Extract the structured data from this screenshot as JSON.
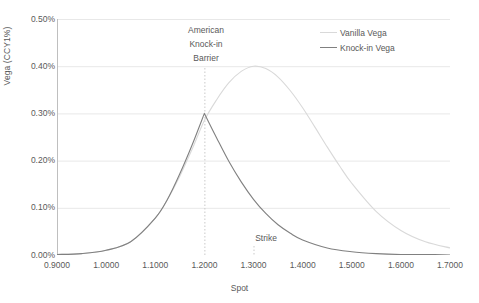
{
  "chart_data": {
    "type": "line",
    "title": "",
    "xlabel": "Spot",
    "ylabel": "Vega (CCY1%)",
    "xlim": [
      0.9,
      1.7
    ],
    "ylim": [
      0.0,
      0.005
    ],
    "grid": true,
    "grid_axis": "y",
    "legend_position": "top-right",
    "x_tick_labels": [
      "0.9000",
      "1.0000",
      "1.1000",
      "1.2000",
      "1.3000",
      "1.4000",
      "1.5000",
      "1.6000",
      "1.7000"
    ],
    "x_tick_values": [
      0.9,
      1.0,
      1.1,
      1.2,
      1.3,
      1.4,
      1.5,
      1.6,
      1.7
    ],
    "y_tick_labels": [
      "0.00%",
      "0.10%",
      "0.20%",
      "0.30%",
      "0.40%",
      "0.50%"
    ],
    "y_tick_values": [
      0.0,
      0.001,
      0.002,
      0.003,
      0.004,
      0.005
    ],
    "colors": {
      "vanilla": "#d9d9d9",
      "knockin": "#808080",
      "gridline": "#e8e8e8",
      "axis": "#bfbfbf",
      "text": "#595959",
      "barrier_line": "#c9c9c9"
    },
    "series": [
      {
        "name": "Vanilla Vega",
        "color": "#d9d9d9",
        "x": [
          0.9,
          0.95,
          1.0,
          1.05,
          1.1,
          1.125,
          1.15,
          1.175,
          1.2,
          1.225,
          1.25,
          1.275,
          1.3,
          1.325,
          1.35,
          1.375,
          1.4,
          1.425,
          1.45,
          1.475,
          1.5,
          1.55,
          1.6,
          1.65,
          1.7
        ],
        "values": [
          1e-05,
          3e-05,
          0.0001,
          0.00028,
          0.00078,
          0.00118,
          0.00167,
          0.00224,
          0.00285,
          0.00329,
          0.00365,
          0.00389,
          0.004,
          0.00395,
          0.00377,
          0.00348,
          0.00312,
          0.00271,
          0.00229,
          0.00189,
          0.00152,
          0.00092,
          0.00052,
          0.00028,
          0.00015
        ]
      },
      {
        "name": "Knock-in Vega",
        "color": "#808080",
        "x": [
          0.9,
          0.95,
          1.0,
          1.05,
          1.1,
          1.125,
          1.15,
          1.175,
          1.2,
          1.225,
          1.25,
          1.275,
          1.3,
          1.325,
          1.35,
          1.375,
          1.4,
          1.45,
          1.5,
          1.55,
          1.6,
          1.65,
          1.7
        ],
        "values": [
          1e-05,
          3e-05,
          0.0001,
          0.00028,
          0.00078,
          0.00118,
          0.00172,
          0.00233,
          0.003,
          0.00248,
          0.00198,
          0.00155,
          0.00118,
          0.00088,
          0.00064,
          0.00046,
          0.00032,
          0.00015,
          7e-05,
          3e-05,
          1e-05,
          1e-05,
          0.0
        ]
      }
    ],
    "annotations": [
      {
        "name": "american-knock-in-barrier",
        "lines": [
          "American",
          "Knock-in",
          "Barrier"
        ],
        "x": 1.2,
        "marker": "dotted-vertical-line"
      },
      {
        "name": "strike",
        "lines": [
          "Strike"
        ],
        "x": 1.3,
        "marker": "dotted-tick"
      }
    ]
  },
  "legend": {
    "items": [
      {
        "label": "Vanilla Vega",
        "color": "#d9d9d9"
      },
      {
        "label": "Knock-in Vega",
        "color": "#808080"
      }
    ]
  },
  "annotations": {
    "barrier": {
      "line1": "American",
      "line2": "Knock-in",
      "line3": "Barrier"
    },
    "strike": {
      "label": "Strike"
    }
  },
  "axes": {
    "x_title": "Spot",
    "y_title": "Vega (CCY1%)",
    "x_ticks": [
      "0.9000",
      "1.0000",
      "1.1000",
      "1.2000",
      "1.3000",
      "1.4000",
      "1.5000",
      "1.6000",
      "1.7000"
    ],
    "y_ticks": [
      "0.50%",
      "0.40%",
      "0.30%",
      "0.20%",
      "0.10%",
      "0.00%"
    ]
  }
}
